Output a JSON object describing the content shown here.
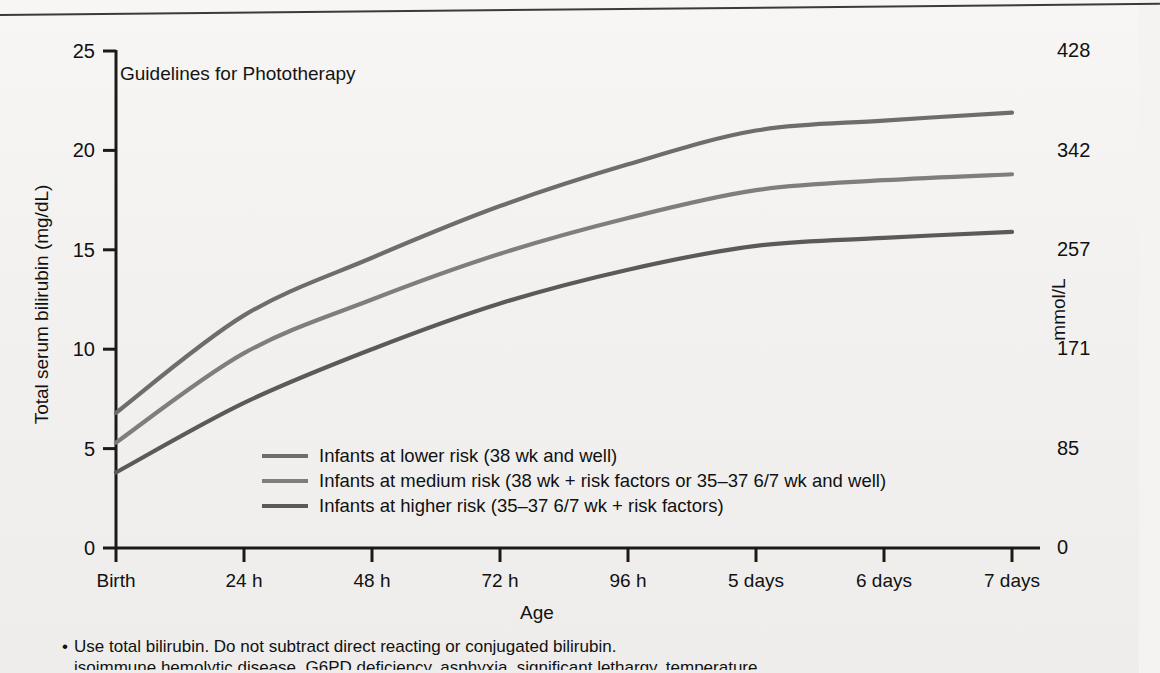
{
  "figure": {
    "title": "Guidelines for Phototherapy",
    "y_axis_title": "Total serum bilirubin (mg/dL)",
    "y2_axis_title": "mmol/L",
    "x_axis_title": "Age"
  },
  "notes": [
    "Use total bilirubin.  Do not subtract direct reacting or conjugated bilirubin.",
    "isoimmune hemolytic disease, G6PD deficiency, asphyxia, significant lethargy, temperature"
  ],
  "colors": {
    "lower_risk": "#6d6d6d",
    "medium_risk": "#7e7e7e",
    "higher_risk": "#5a5a5a",
    "axis": "#1a1a1a",
    "text": "#111111",
    "background": "#f2f1ef"
  },
  "chart_data": {
    "type": "line",
    "title": "Guidelines for Phototherapy",
    "xlabel": "Age",
    "ylabel": "Total serum bilirubin (mg/dL)",
    "y2label": "mmol/L",
    "grid": false,
    "legend_position": "inside-lower-center",
    "xlim": [
      0,
      7
    ],
    "ylim": [
      0,
      25
    ],
    "y2lim": [
      0,
      428
    ],
    "categories": [
      "Birth",
      "24 h",
      "48 h",
      "72 h",
      "96 h",
      "5 days",
      "6 days",
      "7 days"
    ],
    "x": [
      0,
      1,
      2,
      3,
      4,
      5,
      6,
      7
    ],
    "yticks": [
      0,
      5,
      10,
      15,
      20,
      25
    ],
    "y2ticks": [
      0,
      85,
      171,
      257,
      342,
      428
    ],
    "series": [
      {
        "name": "Infants at lower risk (38 wk and well)",
        "legend_label": "Infants at lower risk (38 wk and well)",
        "color": "#6d6d6d",
        "values": [
          6.8,
          11.7,
          14.6,
          17.2,
          19.3,
          21.0,
          21.5,
          21.9
        ]
      },
      {
        "name": "Infants at medium risk (38 wk + risk factors or 35–37 6/7 wk and well)",
        "legend_label": "Infants at medium risk (38 wk + risk factors or 35–37 6/7 wk and well)",
        "color": "#7e7e7e",
        "values": [
          5.3,
          9.8,
          12.5,
          14.8,
          16.6,
          18.0,
          18.5,
          18.8
        ]
      },
      {
        "name": "Infants at higher risk (35–37 6/7 wk + risk factors)",
        "legend_label": "Infants at higher risk (35–37 6/7 wk + risk factors)",
        "color": "#5a5a5a",
        "values": [
          3.8,
          7.3,
          10.0,
          12.3,
          14.0,
          15.2,
          15.6,
          15.9
        ]
      }
    ]
  }
}
